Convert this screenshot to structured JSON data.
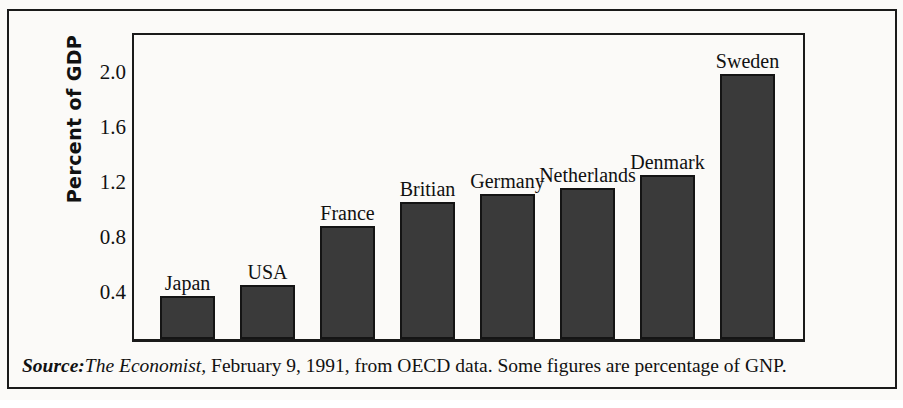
{
  "chart_data": {
    "type": "bar",
    "title": "",
    "subtitle": "",
    "xlabel": "",
    "ylabel": "Percent of GDP",
    "categories": [
      "Japan",
      "USA",
      "France",
      "Britian",
      "Germany",
      "Netherlands",
      "Denmark",
      "Sweden"
    ],
    "values": [
      0.31,
      0.39,
      0.82,
      0.99,
      1.05,
      1.09,
      1.19,
      1.92
    ],
    "ylim": [
      0,
      2.2
    ],
    "yticks": [
      0.4,
      0.8,
      1.2,
      1.6,
      2.0
    ],
    "ytick_labels": [
      "0.4",
      "0.8",
      "1.2",
      "1.6",
      "2.0"
    ],
    "grid": false,
    "legend": false,
    "legend_position": "none",
    "bar_color": "#3a3a3a",
    "bar_edge_color": "#141414",
    "background_color": "#fbfaf8",
    "text_color": "#111111",
    "annotations": [
      {
        "label": "Japan",
        "value": 0.31
      },
      {
        "label": "USA",
        "value": 0.39
      },
      {
        "label": "France",
        "value": 0.82
      },
      {
        "label": "Britian",
        "value": 0.99
      },
      {
        "label": "Germany",
        "value": 1.05
      },
      {
        "label": "Netherlands",
        "value": 1.09
      },
      {
        "label": "Denmark",
        "value": 1.19
      },
      {
        "label": "Sweden",
        "value": 1.92
      }
    ]
  },
  "axis": {
    "y_label": "Percent of GDP",
    "ticks": [
      {
        "label": "2.0",
        "value": 2.0
      },
      {
        "label": "1.6",
        "value": 1.6
      },
      {
        "label": "1.2",
        "value": 1.2
      },
      {
        "label": "0.8",
        "value": 0.8
      },
      {
        "label": "0.4",
        "value": 0.4
      }
    ]
  },
  "source": {
    "prefix": "Source:",
    "publication": "The Economist,",
    "rest": " February 9, 1991, from OECD data. Some figures are percentage of GNP.",
    "full_text": "Source: The Economist, February 9, 1991, from OECD data. Some figures are percentage of GNP."
  }
}
